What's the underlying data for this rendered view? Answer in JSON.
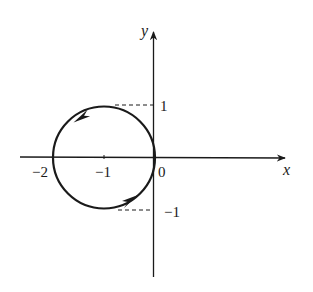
{
  "diagram": {
    "type": "parametric-curve-on-axes",
    "colors": {
      "stroke": "#1a1a1a",
      "background": "#ffffff"
    },
    "axes": {
      "x_label": "x",
      "y_label": "y",
      "origin_label": "0"
    },
    "ticks": {
      "x": [
        {
          "value": -2,
          "label": "−2"
        },
        {
          "value": -1,
          "label": "−1"
        }
      ],
      "y": [
        {
          "value": 1,
          "label": "1"
        },
        {
          "value": -1,
          "label": "−1"
        }
      ]
    },
    "curve": {
      "shape": "circle",
      "center": [
        -1,
        0
      ],
      "radius": 1,
      "direction": "counter-clockwise",
      "arrows": [
        "upper-left arrow pointing down-left",
        "lower-right arrow pointing up-right"
      ]
    },
    "guides": [
      {
        "style": "dashed",
        "from": [
          -1,
          1
        ],
        "to": [
          0,
          1
        ]
      },
      {
        "style": "dashed",
        "from": [
          -1,
          -1
        ],
        "to": [
          0,
          -1
        ]
      }
    ]
  }
}
